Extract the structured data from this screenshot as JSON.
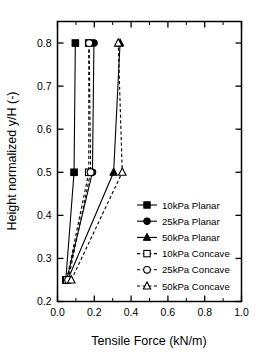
{
  "chart_data": {
    "type": "line",
    "title": "",
    "xlabel": "Tensile Force (kN/m)",
    "ylabel": "Height normalized y/H (-)",
    "xlim": [
      0.0,
      1.0
    ],
    "ylim": [
      0.2,
      0.85
    ],
    "grid": false,
    "legend_position": "center-right-inside",
    "x_ticks": [
      0.0,
      0.2,
      0.4,
      0.6,
      0.8,
      1.0
    ],
    "x_tick_labels": [
      "0.0",
      "0.2",
      "0.4",
      "0.6",
      "0.8",
      "1.0"
    ],
    "x_minor_ticks": [
      0.1,
      0.3,
      0.5,
      0.7,
      0.9
    ],
    "y_ticks": [
      0.2,
      0.3,
      0.4,
      0.5,
      0.6,
      0.7,
      0.8
    ],
    "y_tick_labels": [
      "0.2",
      "0.3",
      "0.4",
      "0.5",
      "0.6",
      "0.7",
      "0.8"
    ],
    "series": [
      {
        "name": "10kPa Planar",
        "style": "solid",
        "marker": "square",
        "marker_fill": "filled",
        "x": [
          0.045,
          0.09,
          0.097
        ],
        "y": [
          0.25,
          0.5,
          0.8
        ]
      },
      {
        "name": "25kPa Planar",
        "style": "solid",
        "marker": "circle",
        "marker_fill": "filled",
        "x": [
          0.05,
          0.19,
          0.198
        ],
        "y": [
          0.25,
          0.5,
          0.8
        ]
      },
      {
        "name": "50kPa Planar",
        "style": "solid",
        "marker": "triangle",
        "marker_fill": "filled",
        "x": [
          0.055,
          0.305,
          0.34
        ],
        "y": [
          0.25,
          0.5,
          0.8
        ]
      },
      {
        "name": "10kPa Concave",
        "style": "dashed",
        "marker": "square",
        "marker_fill": "open",
        "x": [
          0.05,
          0.17,
          0.17
        ],
        "y": [
          0.25,
          0.5,
          0.8
        ]
      },
      {
        "name": "25kPa Concave",
        "style": "dashed",
        "marker": "circle",
        "marker_fill": "open",
        "x": [
          0.058,
          0.18,
          0.172
        ],
        "y": [
          0.25,
          0.5,
          0.8
        ]
      },
      {
        "name": "50kPa Concave",
        "style": "dashed",
        "marker": "triangle",
        "marker_fill": "open",
        "x": [
          0.075,
          0.352,
          0.33
        ],
        "y": [
          0.25,
          0.5,
          0.8
        ]
      }
    ],
    "legend_entries": [
      {
        "label": "10kPa Planar",
        "style": "solid",
        "marker": "square",
        "marker_fill": "filled"
      },
      {
        "label": "25kPa Planar",
        "style": "solid",
        "marker": "circle",
        "marker_fill": "filled"
      },
      {
        "label": "50kPa Planar",
        "style": "solid",
        "marker": "triangle",
        "marker_fill": "filled"
      },
      {
        "label": "10kPa Concave",
        "style": "dashed",
        "marker": "square",
        "marker_fill": "open"
      },
      {
        "label": "25kPa Concave",
        "style": "dashed",
        "marker": "circle",
        "marker_fill": "open"
      },
      {
        "label": "50kPa Concave",
        "style": "dashed",
        "marker": "triangle",
        "marker_fill": "open"
      }
    ],
    "colors": {
      "foreground": "#000000",
      "background": "#ffffff"
    }
  }
}
